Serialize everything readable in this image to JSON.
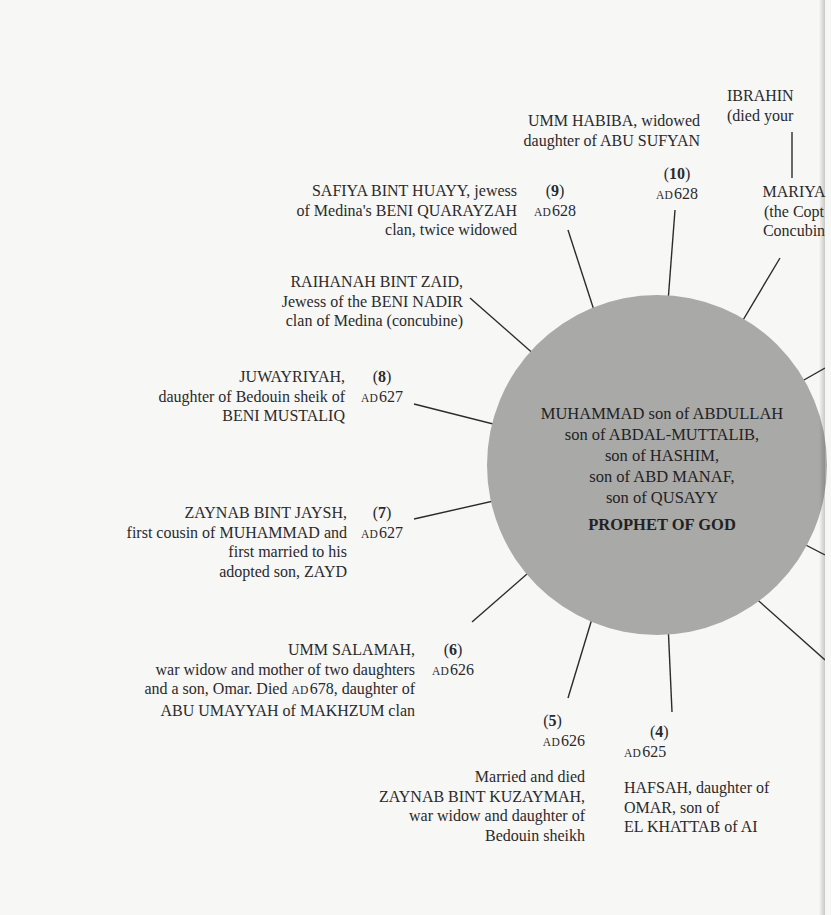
{
  "diagram": {
    "type": "radial",
    "center": {
      "lines": [
        "MUHAMMAD son of ABDULLAH",
        "son of ABDAL-MUTTALIB,",
        "son of HASHIM,",
        "son of ABD MANAF,",
        "son of QUSAYY"
      ],
      "title": "PROPHET OF GOD",
      "fill_color": "#a9a9a8"
    },
    "nodes": [
      {
        "id": "wife-4",
        "number": "4",
        "date_era": "AD",
        "date_year": "625",
        "lines": [
          "HAFSAH, daughter of",
          "OMAR, son of",
          "EL KHATTAB of AI"
        ]
      },
      {
        "id": "wife-5",
        "number": "5",
        "date_era": "AD",
        "date_year": "626",
        "lines": [
          "Married and died",
          "ZAYNAB BINT KUZAYMAH,",
          "war widow and daughter of",
          "Bedouin sheikh"
        ]
      },
      {
        "id": "wife-6",
        "number": "6",
        "date_era": "AD",
        "date_year": "626",
        "lines": [
          "UMM SALAMAH,",
          "war widow and mother of two daughters",
          "and a son, Omar. Died",
          "ABU UMAYYAH of MAKHZUM clan"
        ],
        "inline_date": {
          "era": "AD",
          "year": "678",
          "after": ", daughter of"
        }
      },
      {
        "id": "wife-7",
        "number": "7",
        "date_era": "AD",
        "date_year": "627",
        "lines": [
          "ZAYNAB BINT JAYSH,",
          "first cousin of MUHAMMAD and",
          "first married to his",
          "adopted son, ZAYD"
        ]
      },
      {
        "id": "wife-8",
        "number": "8",
        "date_era": "AD",
        "date_year": "627",
        "lines": [
          "JUWAYRIYAH,",
          "daughter of Bedouin sheik of",
          "BENI MUSTALIQ"
        ]
      },
      {
        "id": "concubine-raihanah",
        "lines": [
          "RAIHANAH BINT ZAID,",
          "Jewess of the BENI NADIR",
          "clan of Medina (concubine)"
        ]
      },
      {
        "id": "wife-9",
        "number": "9",
        "date_era": "AD",
        "date_year": "628",
        "lines": [
          "SAFIYA BINT HUAYY, jewess",
          "of Medina's BENI QUARAYZAH",
          "clan, twice widowed"
        ]
      },
      {
        "id": "wife-10",
        "number": "10",
        "date_era": "AD",
        "date_year": "628",
        "lines": [
          "UMM HABIBA, widowed",
          "daughter of ABU SUFYAN"
        ]
      },
      {
        "id": "concubine-mariya",
        "lines": [
          "MARIYA",
          "(the Copt",
          "Concubin"
        ]
      },
      {
        "id": "son-ibrahim",
        "lines": [
          "IBRAHIN",
          "(died your"
        ]
      }
    ]
  }
}
